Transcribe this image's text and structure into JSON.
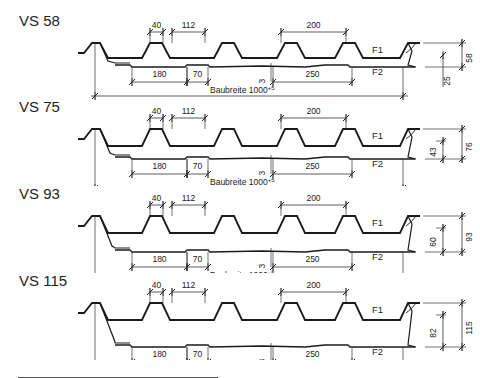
{
  "profiles": [
    {
      "name": "VS 58",
      "height": "58",
      "inner_height": "25",
      "top": 10,
      "inner_dim_below": true
    },
    {
      "name": "VS 75",
      "height": "76",
      "inner_height": "43",
      "top": 96,
      "inner_dim_below": false
    },
    {
      "name": "VS 93",
      "height": "93",
      "inner_height": "60",
      "top": 183,
      "inner_dim_below": false
    },
    {
      "name": "VS 115",
      "height": "115",
      "inner_height": "82",
      "top": 270,
      "inner_dim_below": false
    }
  ],
  "dimensions": {
    "rib_top_width": "40",
    "rib_gap": "112",
    "rib_pitch": "200",
    "f2_segment_a": "180",
    "f2_segment_b": "70",
    "f2_segment_c": "250",
    "f2_offset": "3",
    "build_width": "Baubreite 1000",
    "build_width_tolerance": "+5"
  },
  "layers": {
    "upper": "F1",
    "lower": "F2"
  }
}
